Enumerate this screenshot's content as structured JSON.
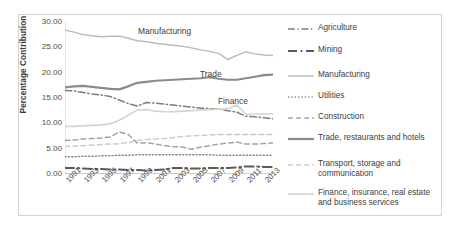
{
  "chart_data": {
    "type": "line",
    "title": "",
    "xlabel": "",
    "ylabel": "Percentage Contribution",
    "ylim": [
      0,
      30
    ],
    "yticks": [
      "0.00",
      "5.00",
      "10.00",
      "15.00",
      "20.00",
      "25.00",
      "30.00"
    ],
    "grid": false,
    "legend_position": "right",
    "x": [
      1991,
      1992,
      1993,
      1994,
      1995,
      1996,
      1997,
      1998,
      1999,
      2000,
      2001,
      2002,
      2003,
      2004,
      2005,
      2006,
      2007,
      2008,
      2009,
      2010,
      2011,
      2012,
      2013,
      2014
    ],
    "xtick_labels": [
      "1991",
      "1993",
      "1995",
      "1997",
      "1999",
      "2001",
      "2003",
      "2005",
      "2007",
      "2009",
      "2011",
      "2013"
    ],
    "annotations": [
      {
        "text": "Manufacturing",
        "series": "Manufacturing"
      },
      {
        "text": "Trade",
        "series": "Trade, restaurants and hotels"
      },
      {
        "text": "Finance",
        "series": "Finance, insurance, real estate and business services"
      }
    ],
    "series": [
      {
        "name": "Agriculture",
        "style": "dash-dot",
        "color": "#7d7d7d",
        "width": 1.5,
        "values": [
          16.5,
          16.4,
          16.1,
          15.8,
          15.6,
          15.3,
          14.6,
          13.9,
          13.4,
          14.1,
          14.0,
          13.8,
          13.6,
          13.4,
          13.2,
          13.0,
          12.9,
          12.8,
          12.5,
          12.2,
          11.4,
          11.3,
          11.1,
          10.9
        ]
      },
      {
        "name": "Mining",
        "style": "dash-dot",
        "color": "#5a5a5a",
        "width": 2.0,
        "values": [
          1.2,
          1.2,
          1.1,
          1.0,
          1.0,
          0.9,
          0.9,
          0.8,
          0.8,
          0.7,
          0.8,
          0.9,
          1.2,
          1.2,
          1.1,
          1.1,
          1.2,
          1.2,
          1.2,
          1.3,
          1.5,
          1.5,
          1.4,
          1.4
        ]
      },
      {
        "name": "Manufacturing",
        "style": "solid",
        "color": "#b9b9b9",
        "width": 1.4,
        "values": [
          28.4,
          28.0,
          27.5,
          27.3,
          27.1,
          27.2,
          27.2,
          26.8,
          26.3,
          26.1,
          25.8,
          25.6,
          25.4,
          25.2,
          24.9,
          24.5,
          24.2,
          23.8,
          22.6,
          23.4,
          24.1,
          23.7,
          23.5,
          23.4
        ]
      },
      {
        "name": "Utilities",
        "style": "dotted",
        "color": "#8a8a8a",
        "width": 1.4,
        "values": [
          3.4,
          3.4,
          3.5,
          3.5,
          3.6,
          3.6,
          3.7,
          3.7,
          3.8,
          3.8,
          3.8,
          3.8,
          3.8,
          3.8,
          3.8,
          3.8,
          3.8,
          3.7,
          3.7,
          3.7,
          3.7,
          3.7,
          3.7,
          3.7
        ]
      },
      {
        "name": "Construction",
        "style": "dashed",
        "color": "#a3a3a3",
        "width": 1.5,
        "values": [
          6.6,
          6.7,
          6.9,
          7.0,
          7.1,
          7.3,
          8.3,
          7.8,
          6.1,
          6.2,
          5.9,
          5.6,
          5.4,
          5.3,
          4.9,
          5.3,
          5.6,
          5.9,
          6.1,
          6.3,
          5.9,
          5.9,
          6.0,
          6.1
        ]
      },
      {
        "name": "Trade, restaurants and hotels",
        "style": "solid",
        "color": "#8b8b8b",
        "width": 2.2,
        "values": [
          17.1,
          17.3,
          17.4,
          17.2,
          17.0,
          16.8,
          16.7,
          17.3,
          18.0,
          18.2,
          18.4,
          18.5,
          18.6,
          18.7,
          18.8,
          18.9,
          19.1,
          18.8,
          18.6,
          18.6,
          18.9,
          19.2,
          19.5,
          19.6
        ]
      },
      {
        "name": "Transport, storage and communication",
        "style": "dashed",
        "color": "#cccccc",
        "width": 1.5,
        "values": [
          5.5,
          5.5,
          5.6,
          5.7,
          5.8,
          5.9,
          6.0,
          6.2,
          6.6,
          6.8,
          6.9,
          7.0,
          7.2,
          7.4,
          7.5,
          7.6,
          7.7,
          7.8,
          7.8,
          7.8,
          7.8,
          7.8,
          7.8,
          7.8
        ]
      },
      {
        "name": "Finance, insurance, real estate and business services",
        "style": "solid",
        "color": "#d4d4d4",
        "width": 1.6,
        "values": [
          9.4,
          9.4,
          9.5,
          9.6,
          9.7,
          9.9,
          10.6,
          11.6,
          12.6,
          12.7,
          12.4,
          12.3,
          12.3,
          12.4,
          12.5,
          12.6,
          12.7,
          12.8,
          12.9,
          13.6,
          11.8,
          11.8,
          11.9,
          11.9
        ]
      }
    ]
  },
  "legend": {
    "items": [
      {
        "label": "Agriculture"
      },
      {
        "label": "Mining"
      },
      {
        "label": "Manufacturing"
      },
      {
        "label": "Utilities"
      },
      {
        "label": "Construction"
      },
      {
        "label": "Trade, restaurants and hotels"
      },
      {
        "label": "Transport, storage and communication"
      },
      {
        "label": "Finance, insurance, real estate and business services"
      }
    ]
  }
}
